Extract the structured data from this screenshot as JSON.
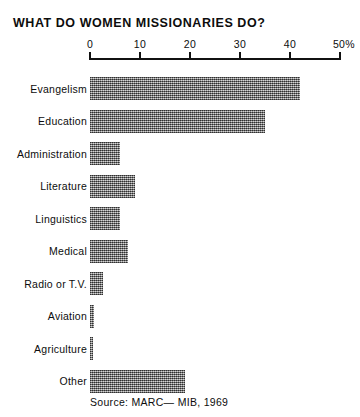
{
  "chart_data": {
    "type": "bar",
    "orientation": "horizontal",
    "title": "WHAT DO WOMEN MISSIONARIES DO?",
    "xlabel": "",
    "ylabel": "",
    "xlim": [
      0,
      50
    ],
    "grid": false,
    "legend": null,
    "axis": {
      "ticks": [
        0,
        10,
        20,
        30,
        40,
        50
      ],
      "tick_labels": [
        "0",
        "10",
        "20",
        "30",
        "40",
        "50%"
      ],
      "position": "top"
    },
    "categories": [
      "Evangelism",
      "Education",
      "Administration",
      "Literature",
      "Linguistics",
      "Medical",
      "Radio or T.V.",
      "Aviation",
      "Agriculture",
      "Other"
    ],
    "values": [
      42,
      35,
      6,
      9,
      6,
      7.5,
      2.5,
      0.8,
      0.6,
      19
    ],
    "source": "Source: MARC— MIB, 1969",
    "colors": {
      "bar_fill": "#8d8d8d",
      "axis": "#111111",
      "text": "#0d0d0d",
      "background": "#ffffff"
    }
  }
}
